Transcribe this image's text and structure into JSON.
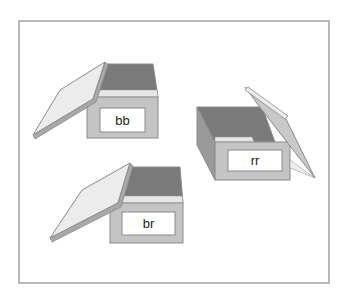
{
  "boxes": [
    {
      "id": "bb",
      "label": "bb",
      "lid_side": "left"
    },
    {
      "id": "rr",
      "label": "rr",
      "lid_side": "right"
    },
    {
      "id": "br",
      "label": "br",
      "lid_side": "left"
    }
  ],
  "colors": {
    "frame": "#b8b8b8",
    "box_face": "#c4c4c4",
    "box_interior": "#7a7a7a",
    "lid_top": "#ececec",
    "lid_edge": "#a8a8a8",
    "outline": "#8a8a8a",
    "label_bg": "#ffffff"
  }
}
